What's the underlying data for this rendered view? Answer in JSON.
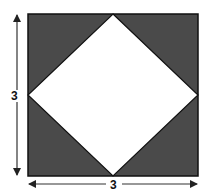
{
  "figure": {
    "side_label_vertical": "3",
    "side_label_horizontal": "3",
    "colors": {
      "shaded": "#4a4a4a",
      "inner": "#ffffff",
      "stroke": "#111111",
      "arrow": "#333333"
    }
  }
}
